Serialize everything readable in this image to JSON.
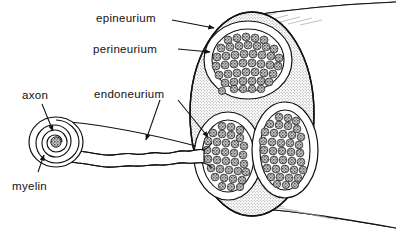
{
  "figure": {
    "background_color": "#ffffff",
    "ink_color": "#111111",
    "stipple_color": "#9a9a9a"
  },
  "labels": {
    "epineurium": "epineurium",
    "perineurium": "perineurium",
    "endoneurium": "endoneurium",
    "axon": "axon",
    "myelin": "myelin"
  },
  "structures": {
    "nerve_trunk": "nerve-trunk",
    "epineurium_sheath": "epineurium-sheath",
    "fascicles": [
      {
        "name": "fascicle-top",
        "axon_count": 46
      },
      {
        "name": "fascicle-lower-left",
        "axon_count": 34
      },
      {
        "name": "fascicle-lower-right",
        "axon_count": 55
      }
    ],
    "myelinated_fiber": "myelinated-nerve-fiber",
    "myelin_spiral_turns": 5
  }
}
